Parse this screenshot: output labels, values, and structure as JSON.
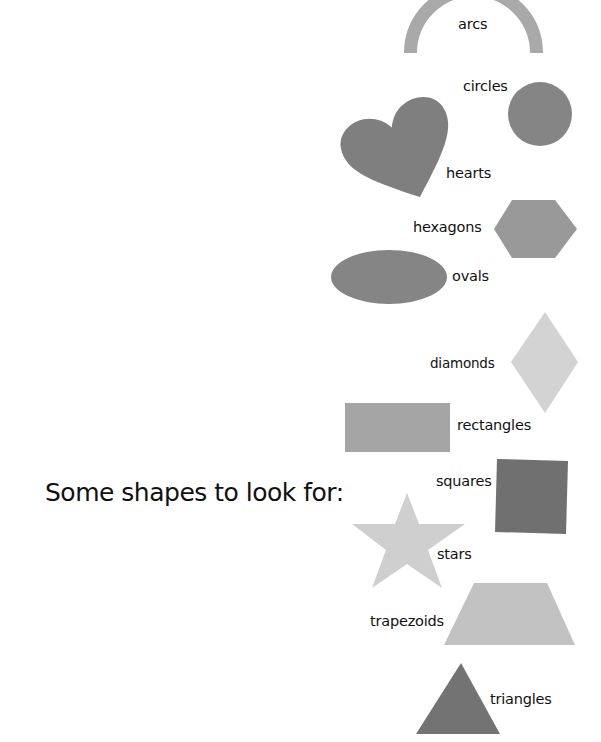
{
  "title": "Some shapes to look for:",
  "colors": {
    "dark_gray": "#7f7f7f",
    "mid_gray": "#a9a9a9",
    "light_gray": "#d0d0d0",
    "text": "#111111",
    "background": "#ffffff"
  },
  "shapes": [
    {
      "name": "arcs",
      "label": "arcs",
      "color": "#a9a9a9"
    },
    {
      "name": "circles",
      "label": "circles",
      "color": "#858585"
    },
    {
      "name": "hearts",
      "label": "hearts",
      "color": "#7f7f7f"
    },
    {
      "name": "hexagons",
      "label": "hexagons",
      "color": "#999999"
    },
    {
      "name": "ovals",
      "label": "ovals",
      "color": "#858585"
    },
    {
      "name": "diamonds",
      "label": "diamonds",
      "color": "#d3d3d3"
    },
    {
      "name": "rectangles",
      "label": "rectangles",
      "color": "#a5a5a5"
    },
    {
      "name": "squares",
      "label": "squares",
      "color": "#707070"
    },
    {
      "name": "stars",
      "label": "stars",
      "color": "#cfcfcf"
    },
    {
      "name": "trapezoids",
      "label": "trapezoids",
      "color": "#c2c2c2"
    },
    {
      "name": "triangles",
      "label": "triangles",
      "color": "#737373"
    }
  ]
}
